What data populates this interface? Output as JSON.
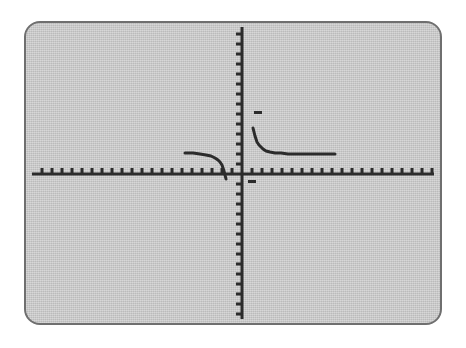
{
  "screen": {
    "device": "graphing-calculator",
    "background_color": "#c6c6c6",
    "border_color": "#6f6f6f",
    "page_background_color": "#ffffff",
    "ink_color": "#2b2b2b"
  },
  "chart_data": {
    "type": "line",
    "title": "",
    "subtitle": "",
    "xlabel": "",
    "ylabel": "",
    "grid": false,
    "legend": null,
    "axes": {
      "x_axis_visible": true,
      "y_axis_visible": true,
      "origin_px": {
        "x": 216,
        "y": 151
      },
      "tick_spacing_px": 10,
      "x_tick_length_px": 5,
      "y_tick_length_px": 5,
      "x_tick_direction": "up",
      "y_tick_direction": "left",
      "tick_labels_shown": false,
      "xlim": [
        -10,
        10
      ],
      "ylim": [
        -10,
        10
      ],
      "xtick_step": 1,
      "ytick_step": 1
    },
    "function": {
      "family": "rational",
      "horizontal_asymptote_y": 0,
      "vertical_asymptote_x": 0.5,
      "branches": [
        "upper-right",
        "lower-left"
      ]
    },
    "series": [
      {
        "name": "branch-upper-right",
        "points_px": [
          [
            253,
            128
          ],
          [
            254,
            132
          ],
          [
            255,
            136
          ],
          [
            256,
            139
          ],
          [
            257,
            142
          ],
          [
            259,
            145
          ],
          [
            261,
            147
          ],
          [
            263,
            149
          ],
          [
            266,
            151
          ],
          [
            270,
            152
          ],
          [
            275,
            153
          ],
          [
            281,
            153
          ],
          [
            288,
            154
          ],
          [
            296,
            154
          ],
          [
            305,
            154
          ],
          [
            315,
            154
          ],
          [
            325,
            154
          ],
          [
            335,
            154
          ]
        ]
      },
      {
        "name": "branch-lower-left",
        "points_px": [
          [
            185,
            153
          ],
          [
            193,
            153
          ],
          [
            200,
            154
          ],
          [
            206,
            155
          ],
          [
            211,
            156
          ],
          [
            215,
            158
          ],
          [
            218,
            160
          ],
          [
            220,
            162
          ],
          [
            222,
            165
          ],
          [
            223,
            168
          ],
          [
            224,
            171
          ],
          [
            225,
            175
          ],
          [
            226,
            179
          ]
        ]
      }
    ],
    "markers": [
      {
        "name": "upper-dash-marker",
        "x_px": 254,
        "y_px": 111,
        "width_px": 8,
        "height_px": 3
      },
      {
        "name": "lower-dash-marker",
        "x_px": 248,
        "y_px": 180,
        "width_px": 8,
        "height_px": 3
      }
    ]
  }
}
